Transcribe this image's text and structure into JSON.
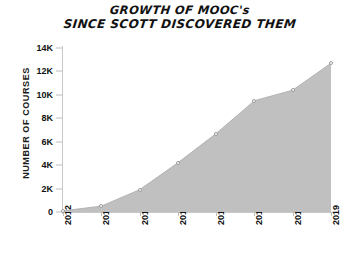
{
  "chart_data": {
    "type": "area",
    "title": "GROWTH OF MOOC's SINCE SCOTT DISCOVERED THEM",
    "title_lines": [
      "GROWTH OF MOOC's",
      "SINCE SCOTT DISCOVERED THEM"
    ],
    "xlabel": "",
    "ylabel": "NUMBER OF COURSES",
    "categories": [
      "2012",
      "2013",
      "2014",
      "2015",
      "2016",
      "2017",
      "2018",
      "2019"
    ],
    "values": [
      100,
      500,
      1900,
      4200,
      6700,
      9500,
      10400,
      12700
    ],
    "ylim": [
      0,
      14000
    ],
    "ytick_values": [
      0,
      2000,
      4000,
      6000,
      8000,
      10000,
      12000,
      14000
    ],
    "ytick_labels": [
      "0",
      "2K",
      "4K",
      "6K",
      "8K",
      "10K",
      "12K",
      "14K"
    ],
    "grid": false,
    "legend": null,
    "markers": true,
    "fill_color": "#c0c0c0",
    "line_color": "#b3b3b3",
    "marker_color": "#ffffff",
    "axis_color": "#c8c8c8",
    "text_color": "#111111",
    "background": "#ffffff"
  }
}
